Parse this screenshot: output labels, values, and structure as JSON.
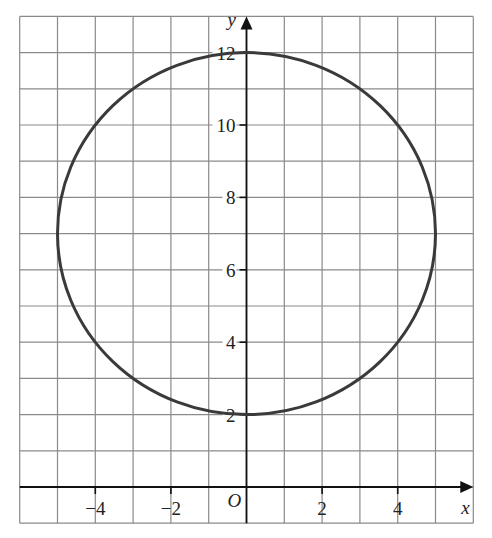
{
  "chart_data": {
    "type": "line",
    "title": "",
    "xlabel": "x",
    "ylabel": "y",
    "origin_label": "O",
    "xlim": [
      -6,
      6
    ],
    "ylim": [
      -1,
      13
    ],
    "grid": true,
    "grid_step": 1,
    "x_ticks": [
      -4,
      -2,
      2,
      4
    ],
    "x_tick_labels": [
      "−4",
      "−2",
      "2",
      "4"
    ],
    "y_ticks": [
      2,
      4,
      6,
      8,
      10,
      12
    ],
    "y_tick_labels": [
      "2",
      "4",
      "6",
      "8",
      "10",
      "12"
    ],
    "series": [
      {
        "name": "circle",
        "shape": "circle",
        "center": [
          0,
          7
        ],
        "radius": 5,
        "equation": "x^2 + (y - 7)^2 = 25",
        "color": "#3a3a3a",
        "key_points": [
          [
            0,
            12
          ],
          [
            0,
            2
          ],
          [
            -5,
            7
          ],
          [
            5,
            7
          ],
          [
            -3,
            11
          ],
          [
            3,
            11
          ],
          [
            -3,
            3
          ],
          [
            3,
            3
          ],
          [
            -4,
            10
          ],
          [
            4,
            10
          ],
          [
            -4,
            4
          ],
          [
            4,
            4
          ]
        ]
      }
    ],
    "legend": null
  },
  "colors": {
    "grid": "#8a8a8a",
    "axis": "#111111",
    "curve": "#3a3a3a"
  }
}
